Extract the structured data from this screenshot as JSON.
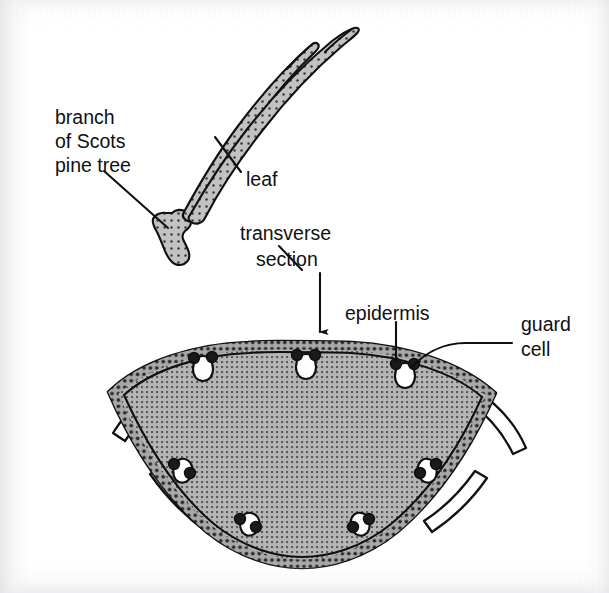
{
  "figure": {
    "background_color": "#ffffff",
    "ink_color": "#101010"
  },
  "labels": {
    "branch": {
      "lines": [
        "branch",
        "of Scots",
        "pine tree"
      ],
      "line1": "branch",
      "line2": "of Scots",
      "line3": "pine tree",
      "x": 55,
      "y": 110
    },
    "leaf": {
      "text": "leaf",
      "x": 246,
      "y": 180
    },
    "transverse_section": {
      "lines": [
        "transverse",
        "section"
      ],
      "line1": "transverse",
      "line2": "section",
      "x": 240,
      "y": 234
    },
    "epidermis": {
      "text": "epidermis",
      "x": 345,
      "y": 314
    },
    "guard_cell": {
      "lines": [
        "guard",
        "cell"
      ],
      "line1": "guard",
      "line2": "cell",
      "x": 521,
      "y": 325
    }
  },
  "structures": {
    "branch": {
      "name": "branch of Scots pine tree",
      "fill_color": "#b9b9b9"
    },
    "needle_leaf": {
      "name": "paired pine needle leaves",
      "fill_color": "#b9b9b9",
      "count": 2
    },
    "cross_section": {
      "name": "leaf transverse section",
      "mesophyll_fill": "#9c9c9c",
      "epidermis_fill": "#8f8f8f",
      "cuticle_fill": "#ffffff",
      "outline_color": "#101010"
    },
    "guard_cells": {
      "name": "guard cells flanking stomata",
      "fill_color": "#111111",
      "stoma_fill": "#ffffff",
      "stoma_count": 6
    }
  },
  "leaders": {
    "branch_pointer": "diagonal line from branch label to branch base",
    "leaf_pointer": "diagonal line from leaf label to needle",
    "transverse_arrow": "vertical arrow pointing down to cross-section",
    "epidermis_pointer": "vertical line to epidermis band",
    "guard_cell_pointer": "horizontal line to guard cell"
  }
}
